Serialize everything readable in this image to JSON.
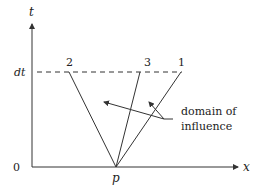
{
  "diagram": {
    "axes": {
      "t_label": "t",
      "x_label": "x",
      "origin_label": "0",
      "dt_label": "dt",
      "p_label": "p"
    },
    "characteristics": [
      {
        "label": "2"
      },
      {
        "label": "3"
      },
      {
        "label": "1"
      }
    ],
    "annotation": {
      "line1": "domain of",
      "line2": "influence"
    },
    "colors": {
      "stroke": "#333333",
      "text": "#222222",
      "background": "#ffffff"
    }
  }
}
